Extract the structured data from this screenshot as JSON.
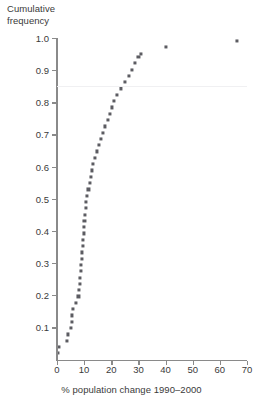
{
  "chart_data": {
    "type": "scatter",
    "title": "",
    "ylabel": "Cumulative\nfrequency",
    "xlabel": "% population change 1990–2000",
    "xlim": [
      0,
      70
    ],
    "ylim": [
      0,
      1.0
    ],
    "grid": true,
    "gridlines_y": [
      0.85
    ],
    "legend": null,
    "xticks": [
      0,
      10,
      20,
      30,
      40,
      50,
      60,
      70
    ],
    "xtick_labels": [
      "0",
      "10",
      "20",
      "30",
      "40",
      "50",
      "60",
      "70"
    ],
    "yticks": [
      0.1,
      0.2,
      0.3,
      0.4,
      0.5,
      0.6,
      0.7,
      0.8,
      0.9,
      1.0
    ],
    "ytick_labels": [
      "0.1",
      "0.2",
      "0.3",
      "0.4",
      "0.5",
      "0.6",
      "0.7",
      "0.8",
      "0.9",
      "1.0"
    ],
    "marker": "small-filled-square",
    "marker_color": "#5c5c62",
    "axis_color": "#8a8a8a",
    "gridline_color": "#f0f0f2",
    "n_points": 51,
    "points": [
      {
        "x": 0.5,
        "y": 0.02
      },
      {
        "x": 0.6,
        "y": 0.039
      },
      {
        "x": 3.6,
        "y": 0.059
      },
      {
        "x": 4.1,
        "y": 0.078
      },
      {
        "x": 5.0,
        "y": 0.098
      },
      {
        "x": 5.4,
        "y": 0.118
      },
      {
        "x": 5.5,
        "y": 0.137
      },
      {
        "x": 5.9,
        "y": 0.157
      },
      {
        "x": 6.9,
        "y": 0.176
      },
      {
        "x": 7.9,
        "y": 0.196
      },
      {
        "x": 8.2,
        "y": 0.216
      },
      {
        "x": 8.5,
        "y": 0.235
      },
      {
        "x": 8.6,
        "y": 0.255
      },
      {
        "x": 8.7,
        "y": 0.275
      },
      {
        "x": 8.9,
        "y": 0.294
      },
      {
        "x": 9.1,
        "y": 0.314
      },
      {
        "x": 9.3,
        "y": 0.333
      },
      {
        "x": 9.6,
        "y": 0.353
      },
      {
        "x": 9.7,
        "y": 0.373
      },
      {
        "x": 9.8,
        "y": 0.392
      },
      {
        "x": 9.9,
        "y": 0.412
      },
      {
        "x": 10.1,
        "y": 0.431
      },
      {
        "x": 10.3,
        "y": 0.451
      },
      {
        "x": 10.5,
        "y": 0.471
      },
      {
        "x": 10.8,
        "y": 0.49
      },
      {
        "x": 11.2,
        "y": 0.51
      },
      {
        "x": 11.6,
        "y": 0.529
      },
      {
        "x": 12.0,
        "y": 0.549
      },
      {
        "x": 12.4,
        "y": 0.569
      },
      {
        "x": 12.9,
        "y": 0.588
      },
      {
        "x": 13.3,
        "y": 0.608
      },
      {
        "x": 14.0,
        "y": 0.627
      },
      {
        "x": 14.6,
        "y": 0.647
      },
      {
        "x": 15.3,
        "y": 0.667
      },
      {
        "x": 16.1,
        "y": 0.686
      },
      {
        "x": 17.0,
        "y": 0.706
      },
      {
        "x": 17.5,
        "y": 0.725
      },
      {
        "x": 18.8,
        "y": 0.745
      },
      {
        "x": 19.5,
        "y": 0.765
      },
      {
        "x": 20.4,
        "y": 0.784
      },
      {
        "x": 21.1,
        "y": 0.804
      },
      {
        "x": 22.0,
        "y": 0.824
      },
      {
        "x": 23.5,
        "y": 0.843
      },
      {
        "x": 25.0,
        "y": 0.863
      },
      {
        "x": 26.4,
        "y": 0.882
      },
      {
        "x": 27.5,
        "y": 0.902
      },
      {
        "x": 28.6,
        "y": 0.922
      },
      {
        "x": 30.0,
        "y": 0.941
      },
      {
        "x": 31.0,
        "y": 0.949
      },
      {
        "x": 40.0,
        "y": 0.971
      },
      {
        "x": 66.3,
        "y": 0.99
      }
    ]
  }
}
